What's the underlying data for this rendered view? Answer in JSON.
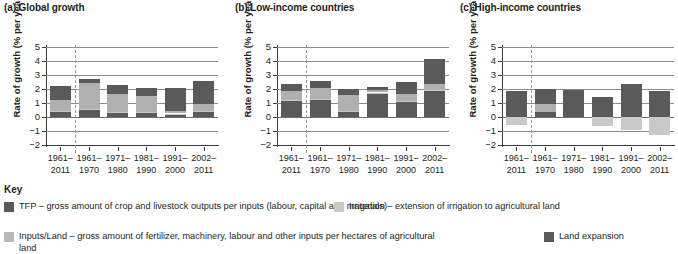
{
  "chart_data": {
    "type": "bar",
    "ylabel": "Rate of growth (% per year)",
    "xlabel": "",
    "ylim": [
      -2,
      5
    ],
    "yticks": [
      -2,
      -1,
      0,
      1,
      2,
      3,
      4,
      5
    ],
    "ytick_labels": [
      "−2",
      "−1",
      "0",
      "1",
      "2",
      "3",
      "4",
      "5"
    ],
    "grid": true,
    "legend_position": "bottom",
    "stacked": true,
    "categories": [
      "1961–2011",
      "1961–1970",
      "1971–1980",
      "1981–1990",
      "1991–2000",
      "2002–2011"
    ],
    "series_order": [
      "land_expansion",
      "irrigation",
      "inputs_land",
      "tfp"
    ],
    "panels": [
      {
        "id": "a",
        "title": "(a) Global growth",
        "series": [
          {
            "name": "Land expansion",
            "key": "land_expansion",
            "color": "#5a5a5a",
            "values": [
              0.35,
              0.55,
              0.33,
              0.32,
              0.2,
              0.38
            ]
          },
          {
            "name": "Irrigation",
            "key": "irrigation",
            "color": "#c9c9c9",
            "values": [
              0.05,
              0.05,
              0.05,
              0.05,
              0.05,
              0.05
            ]
          },
          {
            "name": "Inputs/Land",
            "key": "inputs_land",
            "color": "#b0b0b0",
            "values": [
              0.8,
              1.85,
              1.25,
              1.13,
              0.2,
              0.5
            ]
          },
          {
            "name": "TFP",
            "key": "tfp",
            "color": "#5a5a5a",
            "values": [
              1.0,
              0.25,
              0.65,
              0.6,
              1.6,
              1.62
            ]
          }
        ],
        "totals": [
          2.2,
          2.7,
          2.28,
          2.1,
          2.05,
          2.55
        ]
      },
      {
        "id": "b",
        "title": "(b) Low-income countries",
        "series": [
          {
            "name": "Land expansion",
            "key": "land_expansion",
            "color": "#5a5a5a",
            "values": [
              1.18,
              1.22,
              0.4,
              1.7,
              1.12,
              1.85
            ]
          },
          {
            "name": "Irrigation",
            "key": "irrigation",
            "color": "#c9c9c9",
            "values": [
              0.05,
              0.05,
              0.05,
              0.05,
              0.05,
              0.05
            ]
          },
          {
            "name": "Inputs/Land",
            "key": "inputs_land",
            "color": "#b0b0b0",
            "values": [
              0.6,
              0.83,
              1.12,
              0.2,
              0.5,
              0.45
            ]
          },
          {
            "name": "TFP",
            "key": "tfp",
            "color": "#5a5a5a",
            "values": [
              0.55,
              0.48,
              0.4,
              0.18,
              0.82,
              1.8
            ]
          }
        ],
        "totals": [
          2.38,
          2.58,
          1.97,
          2.13,
          2.49,
          4.15
        ]
      },
      {
        "id": "c",
        "title": "(c) High-income countries",
        "series": [
          {
            "name": "Land expansion",
            "key": "land_expansion",
            "color": "#5a5a5a",
            "values": [
              0.0,
              0.38,
              0.32,
              0.0,
              0.0,
              0.0
            ]
          },
          {
            "name": "Irrigation",
            "key": "irrigation",
            "color": "#c9c9c9",
            "values": [
              -0.55,
              0.0,
              0.0,
              -0.62,
              -0.92,
              -1.3
            ]
          },
          {
            "name": "Inputs/Land",
            "key": "inputs_land",
            "color": "#b0b0b0",
            "values": [
              0.0,
              0.52,
              0.0,
              0.0,
              0.0,
              0.0
            ]
          },
          {
            "name": "TFP",
            "key": "tfp",
            "color": "#5a5a5a",
            "values": [
              1.85,
              1.1,
              1.62,
              1.45,
              2.38,
              1.88
            ]
          }
        ],
        "totals": [
          1.85,
          2.0,
          1.94,
          1.45,
          2.38,
          1.88
        ],
        "negatives": [
          -0.55,
          0.0,
          0.0,
          -0.62,
          -0.92,
          -1.3
        ]
      }
    ],
    "divider_after_category_index": 0
  },
  "key": {
    "title": "Key",
    "items": [
      {
        "name": "tfp",
        "color": "#5a5a5a",
        "label": "TFP – gross amount of crop and livestock outputs per inputs (labour, capital and materials)"
      },
      {
        "name": "irrigation",
        "color": "#c9c9c9",
        "label": "Irrigation – extension of irrigation to agricultural land"
      },
      {
        "name": "inputs-land",
        "color": "#b8b8b8",
        "label": "Inputs/Land – gross amount of fertilizer, machinery, labour and other inputs per hectares of agricultural land"
      },
      {
        "name": "land-expansion",
        "color": "#5a5a5a",
        "label": "Land expansion"
      }
    ]
  }
}
